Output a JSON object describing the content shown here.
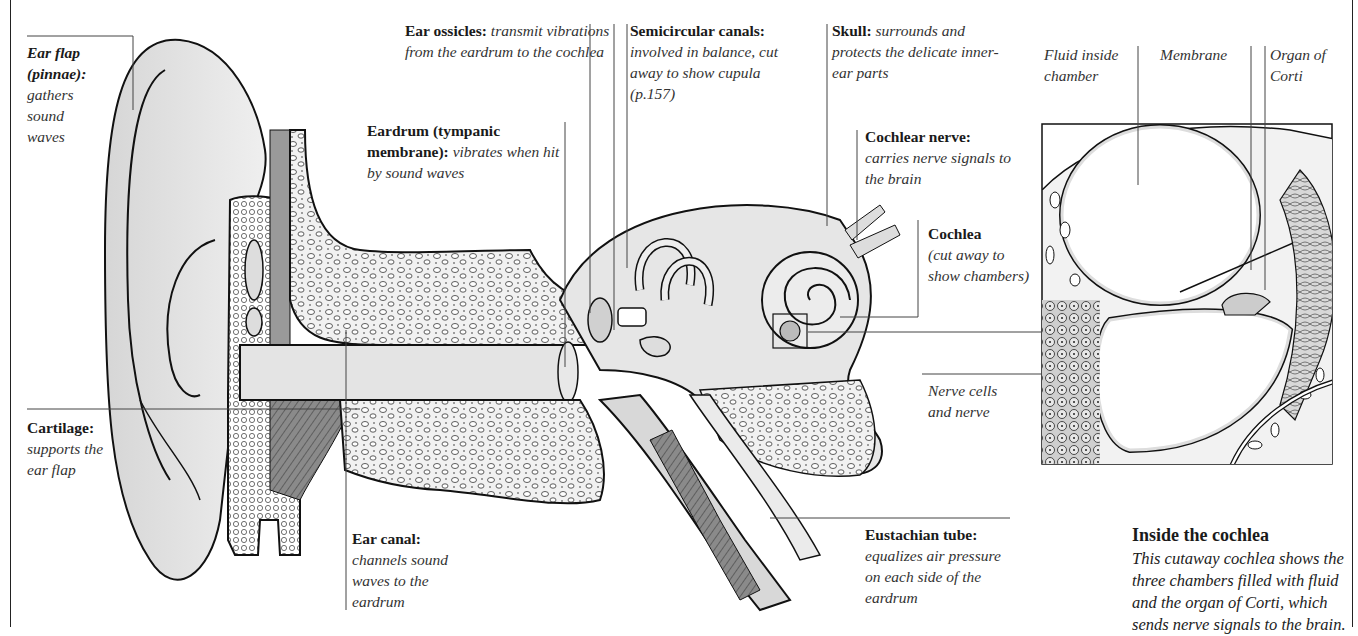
{
  "labels": {
    "ear_flap": {
      "title": "Ear flap (pinnae):",
      "desc": "gathers sound waves"
    },
    "cartilage": {
      "title": "Cartilage:",
      "desc": "supports the ear flap"
    },
    "ear_ossicles": {
      "title": "Ear ossicles:",
      "desc": "transmit vibrations from the eardrum to the cochlea"
    },
    "eardrum": {
      "title": "Eardrum (tympanic membrane):",
      "desc": "vibrates when hit by sound waves"
    },
    "semicircular_canals": {
      "title": "Semicircular canals:",
      "desc": "involved in balance, cut away to show cupula (p.157)"
    },
    "skull": {
      "title": "Skull:",
      "desc": "surrounds and protects the delicate inner-ear parts"
    },
    "cochlear_nerve": {
      "title": "Cochlear nerve:",
      "desc": "carries nerve signals to the brain"
    },
    "cochlea": {
      "title": "Cochlea",
      "desc": "(cut away to show chambers)"
    },
    "nerve_cells": {
      "title": "",
      "desc": "Nerve cells and nerve"
    },
    "ear_canal": {
      "title": "Ear canal:",
      "desc": "channels sound waves to the eardrum"
    },
    "eustachian_tube": {
      "title": "Eustachian tube:",
      "desc": "equalizes air pressure on each side of the eardrum"
    },
    "fluid_chamber": {
      "title": "",
      "desc": "Fluid inside chamber"
    },
    "membrane": {
      "title": "",
      "desc": "Membrane"
    },
    "organ_of_corti": {
      "title": "",
      "desc": "Organ of Corti"
    }
  },
  "inset_caption": {
    "title": "Inside the cochlea",
    "body": "This cutaway cochlea shows the three chambers filled with fluid and the organ of Corti, which sends nerve signals to the brain."
  }
}
